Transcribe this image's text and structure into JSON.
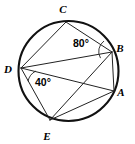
{
  "figure": {
    "type": "circle-geometry-diagram",
    "canvas": {
      "width": 135,
      "height": 144
    },
    "stroke_color": "#222222",
    "circle_color": "#111111",
    "background_color": "#ffffff"
  },
  "circle": {
    "label": "circle",
    "center_x": 68.5,
    "center_y": 71,
    "radius": 50,
    "stroke_width": 2.1
  },
  "vertices": [
    {
      "id": "A",
      "label": "A",
      "x": 114,
      "y": 91,
      "label_x": 121,
      "label_y": 96
    },
    {
      "id": "B",
      "label": "B",
      "x": 112,
      "y": 52,
      "label_x": 120,
      "label_y": 52
    },
    {
      "id": "C",
      "label": "C",
      "x": 66,
      "y": 22,
      "label_x": 63,
      "label_y": 13
    },
    {
      "id": "D",
      "label": "D",
      "x": 21,
      "y": 68,
      "label_x": 8,
      "label_y": 73
    },
    {
      "id": "E",
      "label": "E",
      "x": 50,
      "y": 120,
      "label_x": 47,
      "label_y": 140
    }
  ],
  "chords": [
    {
      "name": "chord-CD",
      "from": "C",
      "to": "D"
    },
    {
      "name": "chord-CB",
      "from": "C",
      "to": "B"
    },
    {
      "name": "chord-BA",
      "from": "B",
      "to": "A"
    },
    {
      "name": "chord-AE",
      "from": "A",
      "to": "E"
    },
    {
      "name": "chord-ED",
      "from": "E",
      "to": "D"
    },
    {
      "name": "diagonal-DB",
      "from": "D",
      "to": "B"
    },
    {
      "name": "diagonal-DA",
      "from": "D",
      "to": "A"
    },
    {
      "name": "diagonal-EB",
      "from": "E",
      "to": "B"
    }
  ],
  "angles": [
    {
      "id": "angle-B",
      "value": "80°",
      "vertex": "B",
      "label_x": 73,
      "label_y": 47,
      "arc": {
        "cx": 112,
        "cy": 52,
        "r": 13,
        "start_deg": 152,
        "end_deg": 232
      }
    },
    {
      "id": "angle-D",
      "value": "40°",
      "vertex": "D",
      "label_x": 35,
      "label_y": 86,
      "arc": {
        "cx": 21,
        "cy": 68,
        "r": 15,
        "start_deg": 12,
        "end_deg": 62
      }
    }
  ]
}
